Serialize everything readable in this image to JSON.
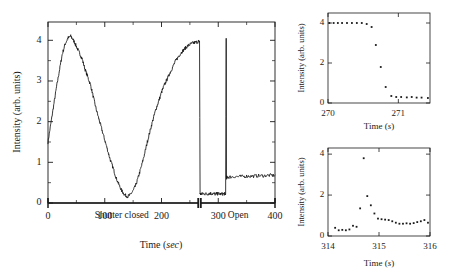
{
  "figure": {
    "background_color": "#ffffff",
    "ink_color": "#1a1a1a"
  },
  "main_plot": {
    "y_axis_title": "Intensity (arb. units)",
    "x_axis_title_main": "Time (",
    "x_axis_title_unit": "sec",
    "x_axis_title_close": ")",
    "x_ticks": [
      "0",
      "100",
      "200",
      "300",
      "400"
    ],
    "y_ticks": [
      "0",
      "1",
      "2",
      "3",
      "4"
    ],
    "annotation_left": "Shutter closed",
    "annotation_right": "Open"
  },
  "inset_top": {
    "y_axis_title": "Intensity (arb. units)",
    "x_axis_title_main": "Time (",
    "x_axis_title_unit": "s",
    "x_axis_title_close": ")",
    "x_ticks": [
      "270",
      "271"
    ],
    "y_ticks": [
      "0",
      "2",
      "4"
    ]
  },
  "inset_bottom": {
    "y_axis_title": "Intensity (arb. units)",
    "x_axis_title_main": "Time (",
    "x_axis_title_unit": "s",
    "x_axis_title_close": ")",
    "x_ticks": [
      "314",
      "315",
      "316"
    ],
    "y_ticks": [
      "0",
      "2",
      "4"
    ]
  },
  "chart_data": [
    {
      "id": "main",
      "type": "line",
      "title": "",
      "xlabel": "Time (sec)",
      "ylabel": "Intensity (arb. units)",
      "xlim": [
        0,
        400
      ],
      "ylim": [
        0,
        4.45
      ],
      "grid": false,
      "legend": null,
      "x_major_ticks": [
        0,
        100,
        200,
        300,
        400
      ],
      "x_minor_ticks": [
        50,
        150,
        250,
        350
      ],
      "y_major_ticks": [
        0,
        1,
        2,
        3,
        4
      ],
      "y_minor_ticks": [
        0.5,
        1.5,
        2.5,
        3.5
      ],
      "annotations": [
        {
          "text": "Shutter closed",
          "x": 130,
          "y": -0.33,
          "span": [
            0,
            267
          ]
        },
        {
          "text": "Open",
          "x": 335,
          "y": -0.33,
          "span": [
            267,
            400
          ]
        }
      ],
      "series": [
        {
          "name": "Intensity vs time",
          "x": [
            0,
            5,
            10,
            15,
            20,
            25,
            30,
            35,
            40,
            45,
            50,
            55,
            60,
            65,
            70,
            75,
            80,
            85,
            90,
            95,
            100,
            105,
            110,
            115,
            120,
            125,
            130,
            135,
            140,
            145,
            150,
            155,
            160,
            165,
            170,
            175,
            180,
            185,
            190,
            195,
            200,
            205,
            210,
            215,
            220,
            225,
            230,
            235,
            240,
            245,
            250,
            255,
            260,
            265,
            267,
            268,
            270,
            275,
            280,
            285,
            290,
            295,
            300,
            305,
            310,
            313,
            314,
            314.5,
            315,
            320,
            330,
            340,
            350,
            360,
            370,
            380,
            390,
            400
          ],
          "y": [
            1.5,
            1.95,
            2.4,
            2.85,
            3.25,
            3.65,
            3.9,
            4.05,
            4.1,
            4.0,
            3.85,
            3.7,
            3.55,
            3.3,
            3.1,
            2.9,
            2.6,
            2.3,
            2.05,
            1.8,
            1.55,
            1.3,
            1.05,
            0.85,
            0.62,
            0.45,
            0.3,
            0.2,
            0.16,
            0.2,
            0.3,
            0.45,
            0.68,
            0.92,
            1.2,
            1.5,
            1.78,
            2.05,
            2.3,
            2.5,
            2.72,
            2.9,
            3.05,
            3.2,
            3.35,
            3.5,
            3.6,
            3.7,
            3.78,
            3.85,
            3.9,
            3.93,
            3.95,
            3.97,
            3.98,
            0.22,
            0.22,
            0.23,
            0.22,
            0.24,
            0.23,
            0.22,
            0.23,
            0.22,
            0.23,
            0.22,
            4.05,
            0.62,
            0.63,
            0.64,
            0.65,
            0.65,
            0.66,
            0.66,
            0.67,
            0.67,
            0.68,
            0.68
          ],
          "notes": "Oscillatory decay-rise while shutter closed; abrupt drop at t~267.5s when shutter opens; plateau ~0.22; sharp spike to ~4.05 at t~314s then steady ~0.65"
        }
      ]
    },
    {
      "id": "inset_top",
      "type": "scatter",
      "title": "",
      "xlabel": "Time (s)",
      "ylabel": "Intensity (arb. units)",
      "xlim": [
        270,
        271.45
      ],
      "ylim": [
        0,
        4.5
      ],
      "grid": false,
      "legend": null,
      "x_major_ticks": [
        270,
        271
      ],
      "y_major_ticks": [
        0,
        2,
        4
      ],
      "series": [
        {
          "name": "Shutter close transient",
          "x": [
            270.02,
            270.08,
            270.14,
            270.2,
            270.27,
            270.34,
            270.41,
            270.48,
            270.55,
            270.62,
            270.68,
            270.75,
            270.82,
            270.9,
            270.97,
            271.04,
            271.12,
            271.19,
            271.26,
            271.33,
            271.42
          ],
          "y": [
            4.0,
            4.0,
            4.0,
            4.0,
            4.0,
            4.0,
            4.0,
            4.0,
            3.95,
            3.8,
            2.9,
            1.8,
            0.8,
            0.35,
            0.3,
            0.3,
            0.28,
            0.3,
            0.27,
            0.27,
            0.25
          ]
        }
      ]
    },
    {
      "id": "inset_bottom",
      "type": "scatter",
      "title": "",
      "xlabel": "Time (s)",
      "ylabel": "Intensity (arb. units)",
      "xlim": [
        314,
        316
      ],
      "ylim": [
        0,
        4.3
      ],
      "grid": false,
      "legend": null,
      "x_major_ticks": [
        314,
        315,
        316
      ],
      "y_major_ticks": [
        0,
        2,
        4
      ],
      "series": [
        {
          "name": "Shutter open transient",
          "x": [
            314.14,
            314.21,
            314.28,
            314.35,
            314.42,
            314.49,
            314.56,
            314.63,
            314.7,
            314.77,
            314.84,
            314.91,
            314.98,
            315.05,
            315.12,
            315.19,
            315.26,
            315.33,
            315.4,
            315.47,
            315.54,
            315.61,
            315.68,
            315.75,
            315.82,
            315.89,
            315.96
          ],
          "y": [
            0.4,
            0.28,
            0.3,
            0.28,
            0.32,
            0.5,
            0.45,
            1.35,
            3.8,
            1.95,
            1.5,
            1.1,
            0.85,
            0.82,
            0.8,
            0.78,
            0.72,
            0.65,
            0.6,
            0.6,
            0.62,
            0.6,
            0.63,
            0.68,
            0.72,
            0.78,
            0.65
          ]
        }
      ]
    }
  ]
}
